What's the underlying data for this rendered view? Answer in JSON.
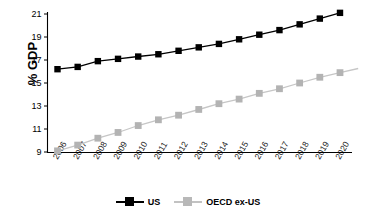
{
  "chart_data": {
    "type": "line",
    "title": "",
    "xlabel": "",
    "ylabel": "% GDP",
    "ylim": [
      9,
      21
    ],
    "yticks": [
      9,
      11,
      13,
      15,
      17,
      19,
      21
    ],
    "grid": false,
    "legend_position": "bottom",
    "categories": [
      "2006",
      "2007",
      "2008",
      "2009",
      "2010",
      "2011",
      "2012",
      "2013",
      "2014",
      "2015",
      "2016",
      "2017",
      "2018",
      "2019",
      "2020"
    ],
    "series": [
      {
        "name": "US",
        "color": "#000000",
        "marker": "square",
        "values": [
          16.2,
          16.4,
          16.9,
          17.1,
          17.3,
          17.5,
          17.8,
          18.1,
          18.4,
          18.8,
          19.2,
          19.6,
          20.1,
          20.6,
          21.1
        ]
      },
      {
        "name": "OECD ex-US",
        "color": "#b3b3b3",
        "marker": "square",
        "values": [
          9.1,
          9.6,
          10.2,
          10.7,
          11.3,
          11.8,
          12.2,
          12.7,
          13.2,
          13.6,
          14.1,
          14.5,
          15.0,
          15.5,
          15.9
        ]
      }
    ]
  },
  "axis": {
    "y_tick_labels": [
      "9",
      "11",
      "13",
      "15",
      "17",
      "19",
      "21"
    ],
    "x_tick_labels": [
      "2006",
      "2007",
      "2008",
      "2009",
      "2010",
      "2011",
      "2012",
      "2013",
      "2014",
      "2015",
      "2016",
      "2017",
      "2018",
      "2019",
      "2020"
    ],
    "y_axis_title": "% GDP"
  },
  "legend": {
    "entries": [
      {
        "label": "US",
        "color": "#000000"
      },
      {
        "label": "OECD ex-US",
        "color": "#b3b3b3"
      }
    ]
  }
}
